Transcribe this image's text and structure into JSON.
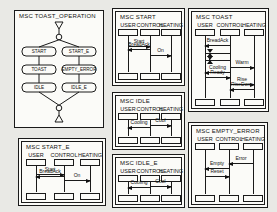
{
  "figure": {
    "background": "#e9e9e5",
    "ink": "#1a1a1a"
  },
  "hmsc": {
    "title": "MSC TOAST_OPERATION",
    "nodes": {
      "left": [
        "START",
        "TOAST",
        "IDLE"
      ],
      "right": [
        "START_E",
        "EMPTY_ERROR",
        "IDLE_E"
      ]
    }
  },
  "msc_panels": [
    {
      "title": "MSC START",
      "lifelines": [
        "USER",
        "CONTROL",
        "HEATING"
      ],
      "messages": [
        {
          "label": "Start",
          "from": 0,
          "to": 1,
          "y": 0.26
        },
        {
          "label": "BreadAck",
          "from": 1,
          "to": 0,
          "y": 0.38
        },
        {
          "label": "On",
          "from": 1,
          "to": 2,
          "y": 0.56
        }
      ]
    },
    {
      "title": "MSC TOAST",
      "lifelines": [
        "USER",
        "CONTROL",
        "HEATING"
      ],
      "messages": [
        {
          "label": "BreadAck",
          "from": 1,
          "to": 0,
          "y": 0.12
        },
        {
          "label": "Warm",
          "from": 1,
          "to": 2,
          "y": 0.52
        },
        {
          "label": "Cooling",
          "from": 1,
          "to": 0,
          "y": 0.61
        },
        {
          "label": "Ready",
          "from": 0,
          "to": 1,
          "y": 0.69
        },
        {
          "label": "Rise",
          "from": 1,
          "to": 2,
          "y": 0.83
        },
        {
          "label": "RiseDone",
          "from": 2,
          "to": 1,
          "y": 0.91
        }
      ],
      "timers": [
        {
          "y": 0.27
        },
        {
          "y": 0.4
        }
      ]
    },
    {
      "title": "MSC IDLE",
      "lifelines": [
        "USER",
        "CONTROL",
        "HEATING"
      ],
      "messages": [
        {
          "label": "Cool",
          "from": 1,
          "to": 2,
          "y": 0.32
        },
        {
          "label": "Cooling",
          "from": 1,
          "to": 0,
          "y": 0.5
        }
      ]
    },
    {
      "title": "MSC START_E",
      "lifelines": [
        "USER",
        "CONTROL",
        "HEATING"
      ],
      "messages": [
        {
          "label": "Start",
          "from": 0,
          "to": 1,
          "y": 0.28
        },
        {
          "label": "BreadAck",
          "from": 1,
          "to": 0,
          "y": 0.4
        },
        {
          "label": "On",
          "from": 1,
          "to": 2,
          "y": 0.58
        }
      ]
    },
    {
      "title": "MSC IDLE_E",
      "lifelines": [
        "USER",
        "CONTROL",
        "HEATING"
      ],
      "messages": [
        {
          "label": "Cooling",
          "from": 1,
          "to": 0,
          "y": 0.5
        },
        {
          "label": "Cool",
          "from": 1,
          "to": 2,
          "y": 0.32
        }
      ]
    },
    {
      "title": "MSC EMPTY_ERROR",
      "lifelines": [
        "USER",
        "CONTROL",
        "HEATING"
      ],
      "messages": [
        {
          "label": "Error",
          "from": 2,
          "to": 1,
          "y": 0.3
        },
        {
          "label": "Empty",
          "from": 1,
          "to": 0,
          "y": 0.43
        },
        {
          "label": "Reset",
          "from": 0,
          "to": 1,
          "y": 0.62
        }
      ]
    }
  ]
}
